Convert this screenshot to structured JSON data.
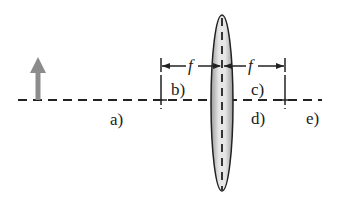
{
  "diagram": {
    "type": "converging lens ray diagram",
    "focal_label": "f",
    "positions": [
      {
        "id": "a",
        "label": "a)"
      },
      {
        "id": "b",
        "label": "b)"
      },
      {
        "id": "c",
        "label": "c)"
      },
      {
        "id": "d",
        "label": "d)"
      },
      {
        "id": "e",
        "label": "e)"
      }
    ],
    "object": "upright-arrow",
    "colors": {
      "line": "#222222",
      "arrow": "#8c8c8c",
      "lens_fill": "#d8d8d8"
    }
  }
}
